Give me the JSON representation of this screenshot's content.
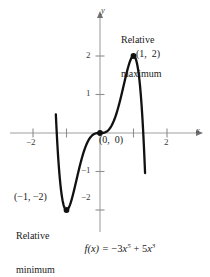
{
  "figure": {
    "kind": "cartesian-plot",
    "background": "#ffffff",
    "curve_color": "#111111",
    "axis_color": "#9a9a9a",
    "point_color": "#111111",
    "axis_labels": {
      "x": "x",
      "y": "y"
    },
    "equation": {
      "lhs": "f(x) = ",
      "term1_sign": "−",
      "term1_coef": "3",
      "term1_var": "x",
      "term1_exp": "5",
      "term2_sign": " + ",
      "term2_coef": "5",
      "term2_var": "x",
      "term2_exp": "3",
      "plain": "f(x) = −3x⁵ + 5x³"
    },
    "annotations": {
      "maximum": {
        "line1": "Relative",
        "line2": "maximum",
        "point": "(1,  2)"
      },
      "minimum": {
        "line1": "Relative",
        "line2": "minimum",
        "point": "(−1, −2)"
      },
      "origin": {
        "point": "(0,  0)"
      }
    }
  },
  "chart_data": {
    "type": "line",
    "title": "",
    "subtitle": "",
    "xlabel": "x",
    "ylabel": "y",
    "equation": "f(x) = -3x^5 + 5x^3",
    "grid": false,
    "legend": "none",
    "xlim": [
      -1.55,
      2.6
    ],
    "ylim": [
      -2.75,
      2.9
    ],
    "xticks": [
      -2,
      2
    ],
    "xtick_labels": [
      "−2",
      "2"
    ],
    "xticks_minor": [
      -1,
      1
    ],
    "yticks": [
      -2,
      -1,
      1,
      2
    ],
    "ytick_labels": [
      "−2",
      "−1",
      "1",
      "2"
    ],
    "series": [
      {
        "name": "f(x) = -3x^5 + 5x^3",
        "color": "#111111",
        "x": [
          -1.3,
          -1.25,
          -1.2,
          -1.15,
          -1.1,
          -1.05,
          -1.0,
          -0.95,
          -0.9,
          -0.85,
          -0.8,
          -0.7,
          -0.6,
          -0.5,
          -0.4,
          -0.3,
          -0.2,
          -0.1,
          0.0,
          0.1,
          0.2,
          0.3,
          0.4,
          0.5,
          0.6,
          0.7,
          0.8,
          0.85,
          0.9,
          0.95,
          1.0,
          1.05,
          1.1,
          1.15,
          1.2,
          1.25,
          1.3
        ],
        "y": [
          2.77,
          1.58,
          0.82,
          0.32,
          0.01,
          -0.17,
          -2.0,
          -0.22,
          -0.12,
          0.01,
          0.02,
          -0.06,
          -0.43,
          -0.53,
          -0.29,
          -0.13,
          -0.04,
          -0.005,
          0.0,
          0.005,
          0.04,
          0.13,
          0.29,
          0.53,
          0.85,
          1.21,
          1.57,
          1.74,
          1.88,
          1.98,
          2.0,
          1.92,
          1.71,
          1.33,
          0.74,
          -0.13,
          -1.4
        ]
      }
    ],
    "annotated_points": [
      {
        "label": "(1,  2)",
        "x": 1,
        "y": 2,
        "note": "Relative maximum"
      },
      {
        "label": "(0,  0)",
        "x": 0,
        "y": 0,
        "note": "Inflection / origin"
      },
      {
        "label": "(−1, −2)",
        "x": -1,
        "y": -2,
        "note": "Relative minimum"
      }
    ]
  }
}
